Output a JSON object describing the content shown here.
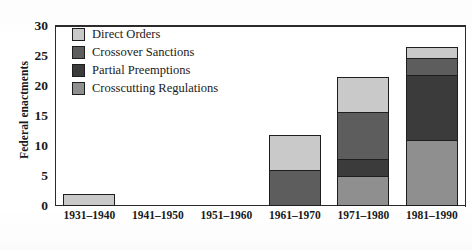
{
  "chart_data": {
    "type": "bar",
    "stacked": true,
    "title": "",
    "xlabel": "",
    "ylabel": "Federal enactments",
    "ylim": [
      0,
      30
    ],
    "yticks": [
      0,
      5,
      10,
      15,
      20,
      25,
      30
    ],
    "grid": false,
    "legend_position": "top-left inside",
    "categories": [
      "1931–1940",
      "1941–1950",
      "1951–1960",
      "1961–1970",
      "1971–1980",
      "1981–1990"
    ],
    "series": [
      {
        "name": "Crosscutting Regulations",
        "color": "#8f8f8f",
        "values": [
          0,
          0,
          0,
          0,
          5,
          11
        ]
      },
      {
        "name": "Partial Preemptions",
        "color": "#3b3b3b",
        "values": [
          0,
          0,
          0,
          0,
          3,
          11
        ]
      },
      {
        "name": "Crossover Sanctions",
        "color": "#5d5d5d",
        "values": [
          0,
          0,
          0,
          6,
          8,
          3
        ]
      },
      {
        "name": "Direct Orders",
        "color": "#c9c9c9",
        "values": [
          2,
          0,
          0,
          6,
          6,
          2
        ]
      }
    ],
    "totals": [
      2,
      0,
      0,
      12,
      22,
      27
    ]
  },
  "legend": {
    "items": [
      {
        "label": "Direct Orders",
        "color": "#c9c9c9"
      },
      {
        "label": "Crossover Sanctions",
        "color": "#5d5d5d"
      },
      {
        "label": "Partial Preemptions",
        "color": "#3b3b3b"
      },
      {
        "label": "Crosscutting Regulations",
        "color": "#8f8f8f"
      }
    ]
  },
  "axis": {
    "y_title": "Federal enactments",
    "y_ticks": [
      "30",
      "25",
      "20",
      "15",
      "10",
      "5",
      "0"
    ],
    "x_ticks": [
      "1931–1940",
      "1941–1950",
      "1951–1960",
      "1961–1970",
      "1971–1980",
      "1981–1990"
    ]
  }
}
